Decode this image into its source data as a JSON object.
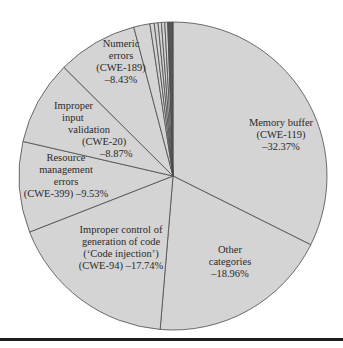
{
  "chart_data": {
    "type": "pie",
    "title": "",
    "start_angle_deg": 0,
    "direction": "clockwise",
    "categories": [
      "Memory buffer (CWE-119)",
      "Other categories",
      "Improper control of generation of code ('Code injection') (CWE-94)",
      "Resource management errors (CWE-399)",
      "Improper input validation (CWE-20)",
      "Numeric errors (CWE-189)",
      "Minor category 1",
      "Minor category 2",
      "Minor category 3",
      "Minor category 4",
      "Minor category 5",
      "Minor category 6",
      "Minor category 7"
    ],
    "values": [
      32.37,
      18.96,
      17.74,
      9.53,
      8.87,
      8.43,
      1.7,
      0.45,
      0.4,
      0.35,
      0.35,
      0.3,
      0.55
    ],
    "labels": [
      {
        "lines": [
          "Memory buffer",
          "(CWE-119)",
          "–32.37%"
        ]
      },
      {
        "lines": [
          "Other",
          "categories",
          "–18.96%"
        ]
      },
      {
        "lines": [
          "Improper control of",
          "generation of code",
          "(‘Code injection’)",
          "(CWE-94) –17.74%"
        ]
      },
      {
        "lines": [
          "Resource",
          "management",
          "errors",
          "(CWE-399) –9.53%"
        ]
      },
      {
        "lines": [
          "Improper",
          "input",
          "validation",
          "(CWE-20)",
          "–8.87%"
        ]
      },
      {
        "lines": [
          "Numeric",
          "errors",
          "(CWE-189)",
          "–8.43%"
        ]
      }
    ],
    "colors": {
      "slice_fill": "#d4d4d4",
      "slice_stroke": "#4a4a4a",
      "minor_dark_fill": "#555555",
      "text": "#2a2a2a",
      "rule": "#1e1e1e"
    },
    "legend": "none (labels inside slices)"
  }
}
